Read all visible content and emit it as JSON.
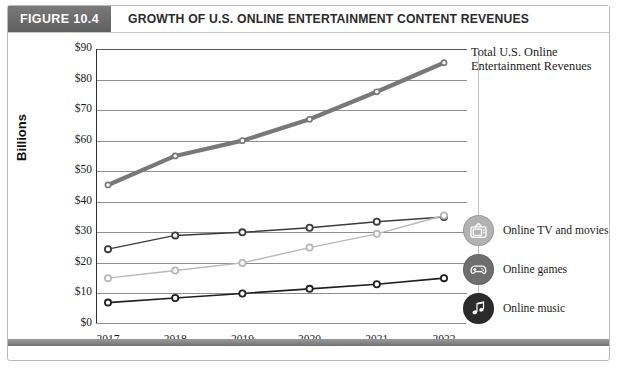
{
  "header": {
    "badge": "FIGURE 10.4",
    "title": "GROWTH OF U.S. ONLINE ENTERTAINMENT CONTENT REVENUES",
    "badge_color": "#6d6d6d",
    "title_color": "#2b2b2b"
  },
  "annotations": {
    "total_label": "Total U.S. Online Entertainment Revenues"
  },
  "legend": [
    {
      "label": "Online TV and movies",
      "icon": "television-icon",
      "color": "#b2b2b2"
    },
    {
      "label": "Online games",
      "icon": "game-controller-icon",
      "color": "#6e6e6e"
    },
    {
      "label": "Online music",
      "icon": "music-note-icon",
      "color": "#2b2b2b"
    }
  ],
  "chart_data": {
    "type": "line",
    "title": "GROWTH OF U.S. ONLINE ENTERTAINMENT CONTENT REVENUES",
    "xlabel": "",
    "ylabel": "Billions",
    "categories": [
      "2017",
      "2018",
      "2019",
      "2020",
      "2021",
      "2022"
    ],
    "ylim": [
      0,
      90
    ],
    "ytick_step": 10,
    "ytick_labels": [
      "$0",
      "$10",
      "$20",
      "$30",
      "$40",
      "$50",
      "$60",
      "$70",
      "$80",
      "$90"
    ],
    "grid": true,
    "legend_position": "right",
    "series": [
      {
        "name": "Total U.S. Online Entertainment Revenues",
        "values": [
          45.5,
          55,
          60,
          67,
          76,
          85.5
        ],
        "color": "#787878",
        "line_width": 4.2,
        "marker": "open-circle"
      },
      {
        "name": "Online games",
        "values": [
          24.5,
          29,
          30,
          31.5,
          33.5,
          35
        ],
        "color": "#3c3c3c",
        "line_width": 1.5,
        "marker": "open-circle"
      },
      {
        "name": "Online TV and movies",
        "values": [
          15,
          17.5,
          20,
          25,
          29.5,
          35.5
        ],
        "color": "#b8b8b8",
        "line_width": 1.4,
        "marker": "open-circle"
      },
      {
        "name": "Online music",
        "values": [
          7,
          8.5,
          10,
          11.5,
          13,
          15
        ],
        "color": "#1f1f1f",
        "line_width": 1.6,
        "marker": "open-circle"
      }
    ]
  }
}
